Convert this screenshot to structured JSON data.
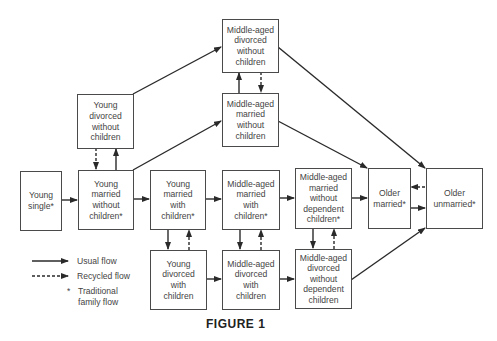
{
  "figure": {
    "caption": "FIGURE 1"
  },
  "nodes": {
    "young_single": "Young\nsingle*",
    "young_married_no_children": "Young\nmarried\nwithout\nchildren*",
    "young_divorced_no_children": "Young\ndivorced\nwithout\nchildren",
    "young_married_with_children": "Young\nmarried\nwith\nchildren*",
    "young_divorced_with_children": "Young\ndivorced\nwith\nchildren",
    "middle_married_with_children": "Middle-aged\nmarried\nwith\nchildren*",
    "middle_divorced_with_children": "Middle-aged\ndivorced\nwith\nchildren",
    "middle_divorced_no_children": "Middle-aged\ndivorced\nwithout\nchildren",
    "middle_married_no_children": "Middle-aged\nmarried\nwithout\nchildren",
    "middle_married_no_dependent": "Middle-aged\nmarried\nwithout\ndependent\nchildren*",
    "middle_divorced_no_dependent": "Middle-aged\ndivorced\nwithout\ndependent\nchildren",
    "older_married": "Older\nmarried*",
    "older_unmarried": "Older\nunmarried*"
  },
  "legend": {
    "usual_flow": "Usual flow",
    "recycled_flow": "Recycled flow",
    "traditional_marker": "*",
    "traditional_flow": "Traditional\nfamily flow"
  },
  "colors": {
    "stroke": "#2a2a2a",
    "box_border": "#4a4a4a",
    "text": "#444444"
  }
}
